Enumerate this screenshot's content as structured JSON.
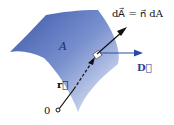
{
  "diagram": {
    "surface_label": "A",
    "equation": "dA⃗ = n⃗ dA",
    "field_vector_label": "D⃗",
    "position_vector_label": "r⃗",
    "origin_label": "0",
    "colors": {
      "surface_dark": "#3a55a8",
      "surface_light": "#e6ecf7",
      "field_arrow": "#2a4aa8",
      "black_arrow": "#111111"
    }
  }
}
